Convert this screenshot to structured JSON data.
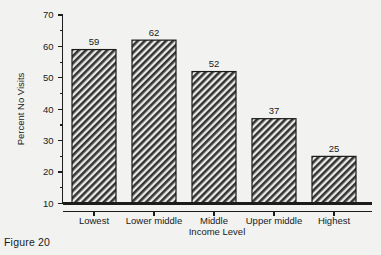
{
  "caption": "Figure 20",
  "chart_data": {
    "type": "bar",
    "title": "",
    "xlabel": "Income Level",
    "ylabel": "Percent No Visits",
    "categories": [
      "Lowest",
      "Lower middle",
      "Middle",
      "Upper middle",
      "Highest"
    ],
    "values": [
      59,
      62,
      52,
      37,
      25
    ],
    "data_labels": [
      "59",
      "62",
      "52",
      "37",
      "25"
    ],
    "ylim": [
      10,
      70
    ],
    "ytick_labels": [
      "10",
      "20",
      "30",
      "40",
      "50",
      "60",
      "70"
    ],
    "ytick_values": [
      10,
      20,
      30,
      40,
      50,
      60,
      70
    ],
    "yminor_values": [
      15,
      25,
      35,
      45,
      55,
      65
    ],
    "grid": "off",
    "legend": "none",
    "bar_fill": "diagonal-hatch",
    "bar_color": "#3a3a3a",
    "bar_edge_color": "#1a1a1a",
    "background_color": "#f2f2f0"
  }
}
